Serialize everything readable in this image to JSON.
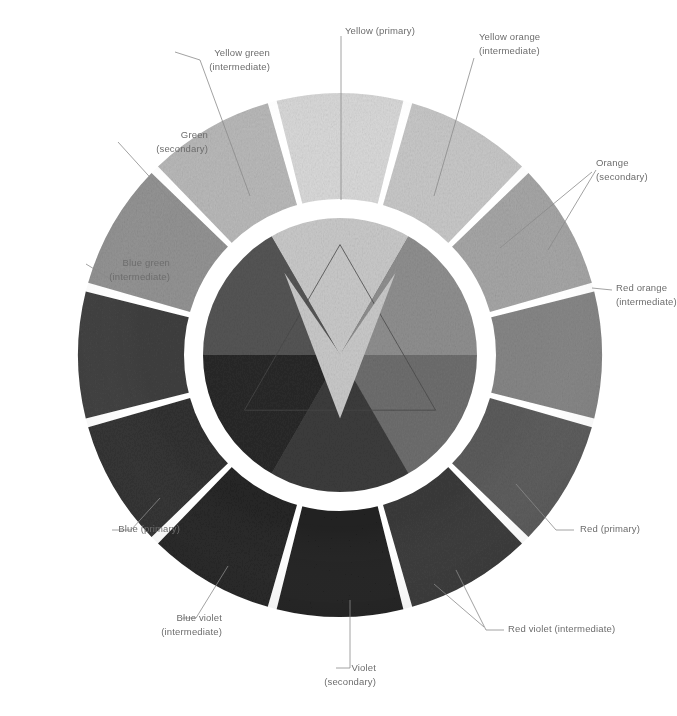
{
  "figure": {
    "kind": "photograph-of-fabric-color-wheel",
    "background_color": "#ffffff",
    "label_color": "#6d6d6d",
    "leader_line_color": "#8a8a8a",
    "center": {
      "x": 340,
      "y": 355
    },
    "outer_radius": 262,
    "ring_inner_radius": 155,
    "inner_disc_radius": 138,
    "segment_count": 12,
    "gap_ring_color": "#ffffff"
  },
  "labels": [
    {
      "id": "yellow-primary",
      "line1": "Yellow (primary)",
      "line2": "",
      "align": "c",
      "x": 380,
      "y": 24,
      "anchor_x": 340,
      "anchor_y": 95,
      "leader": [
        [
          341,
          36
        ],
        [
          341,
          200
        ]
      ]
    },
    {
      "id": "yellow-orange",
      "line1": "Yellow orange",
      "line2": "(intermediate)",
      "align": "l",
      "x": 479,
      "y": 30,
      "anchor_x": 440,
      "anchor_y": 130,
      "leader": [
        [
          474,
          58
        ],
        [
          434,
          196
        ]
      ]
    },
    {
      "id": "yellow-green",
      "line1": "Yellow green",
      "line2": "(intermediate)",
      "align": "r",
      "x": 110,
      "y": 46,
      "anchor_x": 244,
      "anchor_y": 130,
      "leader": [
        [
          175,
          52
        ],
        [
          200,
          60
        ],
        [
          250,
          196
        ]
      ]
    },
    {
      "id": "green-secondary",
      "line1": "Green",
      "line2": "(secondary)",
      "align": "r",
      "x": 48,
      "y": 128,
      "anchor_x": 190,
      "anchor_y": 190,
      "leader": [
        [
          118,
          142
        ],
        [
          196,
          228
        ]
      ]
    },
    {
      "id": "orange-secondary",
      "line1": "Orange",
      "line2": "(secondary)",
      "align": "l",
      "x": 596,
      "y": 156,
      "anchor_x": 492,
      "anchor_y": 215,
      "leader": [
        [
          592,
          172
        ],
        [
          500,
          248
        ]
      ]
    },
    {
      "id": "blue-green",
      "line1": "Blue green",
      "line2": "(intermediate)",
      "align": "r",
      "x": 10,
      "y": 256,
      "anchor_x": 100,
      "anchor_y": 285,
      "leader": [
        [
          86,
          264
        ],
        [
          112,
          280
        ]
      ]
    },
    {
      "id": "red-orange",
      "line1": "Red orange",
      "line2": "(intermediate)",
      "align": "l",
      "x": 616,
      "y": 281,
      "anchor_x": 560,
      "anchor_y": 310,
      "leader": [
        [
          612,
          290
        ],
        [
          592,
          288
        ]
      ]
    },
    {
      "id": "blue-primary",
      "line1": "Blue (primary)",
      "line2": "",
      "align": "r",
      "x": 20,
      "y": 522,
      "anchor_x": 120,
      "anchor_y": 495,
      "leader": [
        [
          112,
          530
        ],
        [
          131,
          530
        ],
        [
          160,
          498
        ]
      ]
    },
    {
      "id": "red-primary",
      "line1": "Red (primary)",
      "line2": "",
      "align": "l",
      "x": 580,
      "y": 522,
      "anchor_x": 520,
      "anchor_y": 480,
      "leader": [
        [
          574,
          530
        ],
        [
          556,
          530
        ],
        [
          516,
          484
        ]
      ]
    },
    {
      "id": "blue-violet",
      "line1": "Blue violet",
      "line2": "(intermediate)",
      "align": "r",
      "x": 62,
      "y": 611,
      "anchor_x": 212,
      "anchor_y": 560,
      "leader": [
        [
          182,
          618
        ],
        [
          196,
          618
        ],
        [
          228,
          566
        ]
      ]
    },
    {
      "id": "red-violet",
      "line1": "Red violet (intermediate)",
      "line2": "",
      "align": "l",
      "x": 508,
      "y": 622,
      "anchor_x": 456,
      "anchor_y": 566,
      "leader": [
        [
          504,
          630
        ],
        [
          486,
          630
        ],
        [
          456,
          570
        ]
      ]
    },
    {
      "id": "violet-secondary",
      "line1": "Violet",
      "line2": "(secondary)",
      "align": "r",
      "x": 216,
      "y": 661,
      "anchor_x": 334,
      "anchor_y": 600,
      "leader": [
        [
          336,
          668
        ],
        [
          350,
          668
        ],
        [
          350,
          600
        ]
      ]
    }
  ],
  "extra_leaders": [
    {
      "id": "red-violet-second",
      "points": [
        [
          484,
          627
        ],
        [
          434,
          584
        ]
      ]
    },
    {
      "id": "orange-second",
      "points": [
        [
          596,
          170
        ],
        [
          548,
          250
        ]
      ]
    }
  ],
  "chart_data": {
    "type": "pie",
    "categories": [
      "Yellow (primary)",
      "Yellow orange (intermediate)",
      "Orange (secondary)",
      "Red orange (intermediate)",
      "Red (primary)",
      "Red violet (intermediate)",
      "Violet (secondary)",
      "Blue violet (intermediate)",
      "Blue (primary)",
      "Blue green (intermediate)",
      "Green (secondary)",
      "Yellow green (intermediate)"
    ],
    "values": [
      30,
      30,
      30,
      30,
      30,
      30,
      30,
      30,
      30,
      30,
      30,
      30
    ],
    "units": "degrees",
    "ring_grays": [
      "#d9d9d9",
      "#c8c8c8",
      "#a6a6a6",
      "#868686",
      "#5c5c5c",
      "#3a3a3a",
      "#222222",
      "#262626",
      "#303030",
      "#3f3f3f",
      "#939393",
      "#b9b9b9"
    ],
    "inner_grays": [
      "#c9c9c9",
      "#8f8f8f",
      "#6e6e6e",
      "#3c3c3c",
      "#2a2a2a",
      "#555555"
    ],
    "inner_names": [
      "Yellow",
      "Orange",
      "Red",
      "Violet",
      "Blue",
      "Green"
    ],
    "legend_position": "callout-labels",
    "grid": false
  }
}
